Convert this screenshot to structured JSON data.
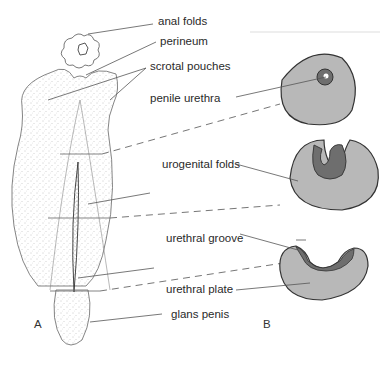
{
  "labels": {
    "anal_folds": "anal folds",
    "perineum": "perineum",
    "scrotal_pouches": "scrotal pouches",
    "penile_urethra": "penile urethra",
    "urogenital_folds": "urogenital folds",
    "urethral_groove": "urethral groove",
    "urethral_plate": "urethral plate",
    "glans_penis": "glans penis"
  },
  "panels": {
    "a": "A",
    "b": "B"
  },
  "colors": {
    "tissue_fill": "#b8b8b8",
    "epithelium_fill": "#6e6e6e",
    "outline": "#333333",
    "leader": "#555555"
  }
}
